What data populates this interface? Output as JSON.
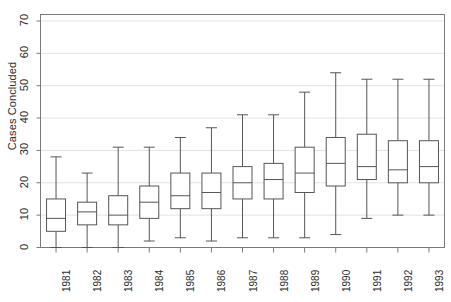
{
  "chart_data": {
    "type": "box",
    "title": "",
    "xlabel": "",
    "ylabel": "Cases Concluded",
    "ylim": [
      0,
      72
    ],
    "yticks": [
      0,
      10,
      20,
      30,
      40,
      50,
      60,
      70
    ],
    "ytick_labels": [
      "0",
      "10",
      "20",
      "30",
      "40",
      "50",
      "60",
      "70"
    ],
    "grid": true,
    "grid_axis": "y",
    "legend": "none",
    "categories": [
      "1981",
      "1982",
      "1983",
      "1984",
      "1985",
      "1986",
      "1987",
      "1988",
      "1989",
      "1990",
      "1991",
      "1992",
      "1993"
    ],
    "boxes": [
      {
        "category": "1981",
        "whisker_low": 0,
        "q1": 5,
        "median": 9,
        "q3": 15,
        "whisker_high": 28
      },
      {
        "category": "1982",
        "whisker_low": 0,
        "q1": 7,
        "median": 11,
        "q3": 14,
        "whisker_high": 23
      },
      {
        "category": "1983",
        "whisker_low": 0,
        "q1": 7,
        "median": 10,
        "q3": 16,
        "whisker_high": 31
      },
      {
        "category": "1984",
        "whisker_low": 2,
        "q1": 9,
        "median": 14,
        "q3": 19,
        "whisker_high": 31
      },
      {
        "category": "1985",
        "whisker_low": 3,
        "q1": 12,
        "median": 16,
        "q3": 23,
        "whisker_high": 34
      },
      {
        "category": "1986",
        "whisker_low": 2,
        "q1": 12,
        "median": 17,
        "q3": 23,
        "whisker_high": 37
      },
      {
        "category": "1987",
        "whisker_low": 3,
        "q1": 15,
        "median": 20,
        "q3": 25,
        "whisker_high": 41
      },
      {
        "category": "1988",
        "whisker_low": 3,
        "q1": 15,
        "median": 21,
        "q3": 26,
        "whisker_high": 41
      },
      {
        "category": "1989",
        "whisker_low": 3,
        "q1": 17,
        "median": 23,
        "q3": 31,
        "whisker_high": 48
      },
      {
        "category": "1990",
        "whisker_low": 4,
        "q1": 19,
        "median": 26,
        "q3": 34,
        "whisker_high": 54
      },
      {
        "category": "1991",
        "whisker_low": 9,
        "q1": 21,
        "median": 25,
        "q3": 35,
        "whisker_high": 52
      },
      {
        "category": "1992",
        "whisker_low": 10,
        "q1": 20,
        "median": 24,
        "q3": 33,
        "whisker_high": 52
      },
      {
        "category": "1993",
        "whisker_low": 10,
        "q1": 20,
        "median": 25,
        "q3": 33,
        "whisker_high": 52
      }
    ],
    "colors": {
      "box_stroke": "#555555",
      "whisker_stroke": "#555555",
      "median_stroke": "#555555",
      "grid": "#e2e2e2",
      "frame": "#7a7a7a",
      "text": "#2b2b2b",
      "background": "#ffffff"
    }
  }
}
